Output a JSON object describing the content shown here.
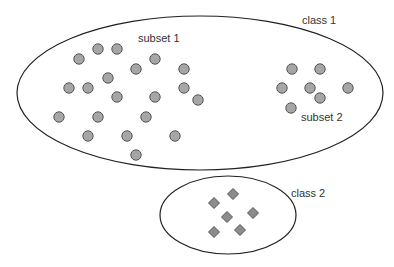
{
  "labels": {
    "class1": "class 1",
    "class2": "class 2",
    "subset1": "subset 1",
    "subset2": "subset 2"
  },
  "colors": {
    "background": "#ffffff",
    "outline": "#222222",
    "marker_fill": "#a6a6a6",
    "marker_stroke": "#555555",
    "text": "#333333"
  },
  "class1": {
    "ellipse": {
      "cx": 200,
      "cy": 93,
      "rx": 183,
      "ry": 77
    },
    "subset1_points": [
      [
        79,
        59
      ],
      [
        98,
        49
      ],
      [
        117,
        49
      ],
      [
        136,
        69
      ],
      [
        155,
        59
      ],
      [
        184,
        69
      ],
      [
        108,
        78
      ],
      [
        69,
        88
      ],
      [
        88,
        88
      ],
      [
        184,
        88
      ],
      [
        198,
        100
      ],
      [
        117,
        97
      ],
      [
        155,
        97
      ],
      [
        59,
        117
      ],
      [
        98,
        117
      ],
      [
        146,
        117
      ],
      [
        88,
        136
      ],
      [
        127,
        136
      ],
      [
        175,
        136
      ],
      [
        136,
        155
      ]
    ],
    "subset2_points": [
      [
        292,
        69
      ],
      [
        320,
        69
      ],
      [
        282,
        88
      ],
      [
        310,
        88
      ],
      [
        348,
        88
      ],
      [
        320,
        98
      ],
      [
        291,
        108
      ]
    ],
    "marker": "circle"
  },
  "class2": {
    "ellipse": {
      "cx": 228,
      "cy": 215,
      "rx": 68,
      "ry": 39
    },
    "points": [
      [
        233,
        194
      ],
      [
        214,
        203
      ],
      [
        227,
        217
      ],
      [
        253,
        213
      ],
      [
        214,
        232
      ],
      [
        240,
        230
      ]
    ],
    "marker": "diamond"
  }
}
